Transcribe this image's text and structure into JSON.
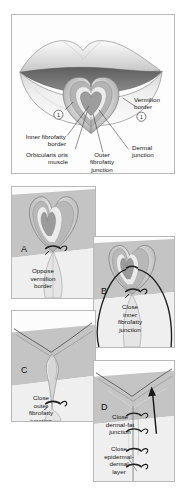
{
  "figure": {
    "title_visible": false,
    "background_color": "#ffffff",
    "panel_border_color": "#b9b9b9"
  },
  "top_panel": {
    "name": "lip-anatomy-panel",
    "labels": [
      {
        "id": "vermilion-border",
        "text": "Vermilion\nborder",
        "line1": "Vermilion",
        "line2": "border"
      },
      {
        "id": "inner-fibrofatty-border",
        "text": "Inner fibrofatty\nborder",
        "line1": "Inner fibrofatty",
        "line2": "border"
      },
      {
        "id": "orbicularis-oris-muscle",
        "text": "Orbicularis oris\nmuscle",
        "line1": "Orbicularis oris",
        "line2": "muscle"
      },
      {
        "id": "outer-fibrofatty-junction",
        "text": "Outer\nfibrofatty\njunction",
        "line1": "Outer",
        "line2": "fibrofatty",
        "line3": "junction"
      },
      {
        "id": "dermal-junction",
        "text": "Dermal\njunction",
        "line1": "Dermal",
        "line2": "junction"
      }
    ],
    "markers": [
      {
        "id": "marker-1-left",
        "value": "1"
      },
      {
        "id": "marker-1-right",
        "value": "1"
      }
    ]
  },
  "panels": [
    {
      "letter": "A",
      "name": "panel-a-oppose-vermilion-border",
      "caption_lines": [
        "Oppose",
        "vermilion",
        "border"
      ],
      "caption": "Oppose vermilion border"
    },
    {
      "letter": "B",
      "name": "panel-b-close-inner-fibrofatty-junction",
      "caption_lines": [
        "Close",
        "inner",
        "fibrofatty",
        "junction"
      ],
      "caption": "Close inner fibrofatty junction"
    },
    {
      "letter": "C",
      "name": "panel-c-close-outer-fibrofatty-junction",
      "caption_lines": [
        "Close",
        "outer",
        "fibrofatty",
        "junction"
      ],
      "caption": "Close outer fibrofatty junction"
    },
    {
      "letter": "D",
      "name": "panel-d-close-dermal-fat-junction",
      "caption_lines": [
        "Close",
        "dermal-fat",
        "junction"
      ],
      "caption": "Close dermal-fat junction",
      "caption2_lines": [
        "Close",
        "epidermal-",
        "dermal",
        "layer"
      ],
      "caption2": "Close epidermal-dermal layer"
    }
  ],
  "colors": {
    "skin_light": "#e2e2e2",
    "skin_mid": "#c9c9c9",
    "skin_dark": "#a9a9a9",
    "mouth_dark": "#6f6f6f",
    "muscle_gray": "#9b9b9b",
    "vermilion_pale": "#ededed",
    "suture_dark": "#2a2a2a",
    "outline": "#555555"
  }
}
